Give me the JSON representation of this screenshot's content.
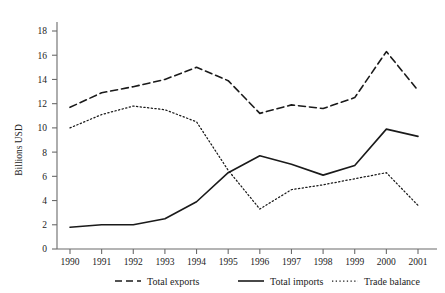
{
  "chart_data": {
    "type": "line",
    "title": "",
    "xlabel": "",
    "ylabel": "Billions USD",
    "categories": [
      "1990",
      "1991",
      "1992",
      "1993",
      "1994",
      "1995",
      "1996",
      "1997",
      "1998",
      "1999",
      "2000",
      "2001"
    ],
    "x": [
      1990,
      1991,
      1992,
      1993,
      1994,
      1995,
      1996,
      1997,
      1998,
      1999,
      2000,
      2001
    ],
    "xlim": [
      1990,
      2001
    ],
    "ylim": [
      0,
      19
    ],
    "yticks": [
      0,
      2,
      4,
      6,
      8,
      10,
      12,
      14,
      16,
      18
    ],
    "ytick_labels": [
      "0",
      "2",
      "4",
      "6",
      "8",
      "10",
      "12",
      "14",
      "16",
      "18"
    ],
    "grid": false,
    "legend_position": "bottom",
    "series": [
      {
        "name": "Total exports",
        "style": "dashed",
        "color": "#1a1a1a",
        "values": [
          11.7,
          12.9,
          13.4,
          14.0,
          15.0,
          13.9,
          11.2,
          11.9,
          11.6,
          12.5,
          16.3,
          13.1
        ]
      },
      {
        "name": "Total imports",
        "style": "solid",
        "color": "#1a1a1a",
        "values": [
          1.8,
          2.0,
          2.0,
          2.5,
          3.9,
          6.3,
          7.7,
          7.0,
          6.1,
          6.9,
          9.9,
          9.3
        ]
      },
      {
        "name": "Trade balance",
        "style": "dotted",
        "color": "#1a1a1a",
        "values": [
          10.0,
          11.1,
          11.8,
          11.5,
          10.5,
          6.5,
          3.3,
          4.9,
          5.3,
          5.8,
          6.3,
          3.6
        ]
      }
    ]
  },
  "axis": {
    "y_title": "Billions USD"
  },
  "legend": {
    "items": [
      {
        "label": "Total exports"
      },
      {
        "label": "Total imports"
      },
      {
        "label": "Trade balance"
      }
    ]
  }
}
